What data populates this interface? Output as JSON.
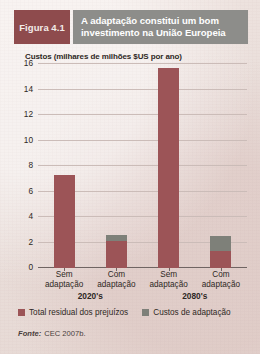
{
  "figure": {
    "tag_prefix": "Figura",
    "tag_number": "4.1",
    "title_line1": "A adaptação constitui um bom",
    "title_line2": "investimento na União Europeia",
    "tag_color": "#8e4b4d",
    "title_bar_color": "#8d8d8a"
  },
  "source": {
    "label": "Fonte:",
    "value": "CEC 2007b."
  },
  "legend": {
    "items": [
      {
        "label": "Total residual dos prejuízos",
        "color": "#9c5457",
        "key": "damage"
      },
      {
        "label": "Custos de adaptação",
        "color": "#7e8079",
        "key": "adapt"
      }
    ]
  },
  "chart_data": {
    "type": "bar",
    "stacked": true,
    "title": "A adaptação constitui um bom investimento na União Europeia",
    "ylabel": "Custos (milhares de milhões $US por ano)",
    "xlabel": "",
    "ylim": [
      0,
      16
    ],
    "yticks": [
      0,
      2,
      4,
      6,
      8,
      10,
      12,
      14,
      16
    ],
    "ytick_labels": [
      "0",
      "2",
      "4",
      "6",
      "8",
      "10",
      "12",
      "14",
      "16"
    ],
    "grid": true,
    "legend_position": "bottom-left",
    "groups": [
      "2020's",
      "2080's"
    ],
    "categories": [
      "Sem adaptação",
      "Com adaptação",
      "Sem adaptação",
      "Com adaptação"
    ],
    "category_lines": [
      [
        "Sem",
        "adaptação"
      ],
      [
        "Com",
        "adaptação"
      ],
      [
        "Sem",
        "adaptação"
      ],
      [
        "Com",
        "adaptação"
      ]
    ],
    "series": [
      {
        "name": "Total residual dos prejuízos",
        "color": "#9c5457",
        "values": [
          7.3,
          2.1,
          15.7,
          1.3
        ]
      },
      {
        "name": "Custos de adaptação",
        "color": "#7e8079",
        "values": [
          0,
          0.5,
          0,
          1.2
        ]
      }
    ],
    "bars": [
      {
        "group": "2020's",
        "category": "Sem adaptação",
        "damage": 7.3,
        "adapt": 0,
        "total": 7.3
      },
      {
        "group": "2020's",
        "category": "Com adaptação",
        "damage": 2.1,
        "adapt": 0.5,
        "total": 2.6
      },
      {
        "group": "2080's",
        "category": "Sem adaptação",
        "damage": 15.7,
        "adapt": 0,
        "total": 15.7
      },
      {
        "group": "2080's",
        "category": "Com adaptação",
        "damage": 1.3,
        "adapt": 1.2,
        "total": 2.5
      }
    ]
  }
}
